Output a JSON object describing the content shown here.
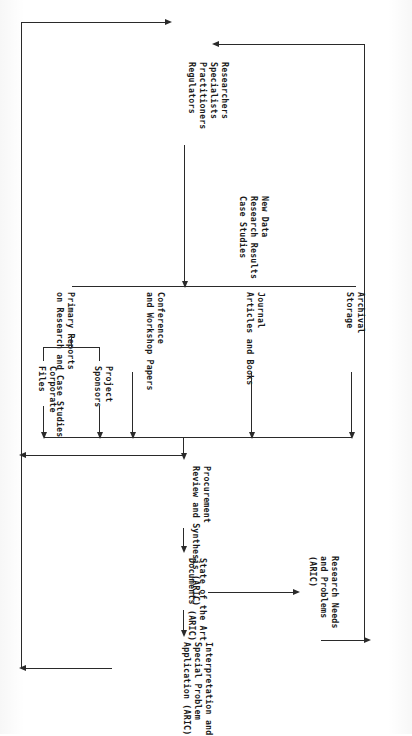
{
  "diagram": {
    "type": "flowchart",
    "orientation": "rotated-90-clockwise",
    "nodes": {
      "primary_reports": "Primary Reports\non Research and Case Studies",
      "project_sponsors": "Project\nSponsors",
      "corporate_files": "Corporate\nFiles",
      "conference_papers": "Conference\nand Workshop Papers",
      "journal_articles": "Journal\nArticles and Books",
      "archival_storage": "Archival\nStorage",
      "producers": "Researchers\nSpecialists\nPractitioners\nRegulators",
      "new_data": "New Data\nResearch Results\nCase Studies",
      "procurement": "Procurement\nReview and Synthesis (ARIC)",
      "state_of_art": "State of the Art\nDocuments (ARIC)",
      "interpretation": "Interpretation and\nSpecial Problem\nApplication (ARIC)",
      "research_needs": "Research Needs\nand Problems\n(ARIC)"
    },
    "node_lines": {
      "primary_reports": [
        "Primary Reports",
        "on Research and Case Studies"
      ],
      "project_sponsors": [
        "Project",
        "Sponsors"
      ],
      "corporate_files": [
        "Corporate",
        "Files"
      ],
      "conference_papers": [
        "Conference",
        "and Workshop Papers"
      ],
      "journal_articles": [
        "Journal",
        "Articles and Books"
      ],
      "archival_storage": [
        "Archival",
        "Storage"
      ],
      "producers": [
        "Researchers",
        "Specialists",
        "Practitioners",
        "Regulators"
      ],
      "new_data": [
        "New Data",
        "Research Results",
        "Case Studies"
      ],
      "procurement": [
        "Procurement",
        "Review and Synthesis (ARIC)"
      ],
      "state_of_art": [
        "State of the Art",
        "Documents (ARIC)"
      ],
      "interpretation": [
        "Interpretation and",
        "Special Problem",
        "Application (ARIC)"
      ],
      "research_needs": [
        "Research Needs",
        "and Problems",
        "(ARIC)"
      ]
    },
    "edges": [
      {
        "from": "project_sponsors",
        "to": "procurement"
      },
      {
        "from": "corporate_files",
        "to": "procurement"
      },
      {
        "from": "conference_papers",
        "to": "procurement"
      },
      {
        "from": "journal_articles",
        "to": "procurement"
      },
      {
        "from": "archival_storage",
        "to": "procurement"
      },
      {
        "from": "procurement",
        "to": "state_of_art"
      },
      {
        "from": "state_of_art",
        "to": "interpretation"
      },
      {
        "from": "state_of_art",
        "to": "research_needs"
      },
      {
        "from": "research_needs",
        "to": "producers"
      },
      {
        "from": "producers",
        "to": "literature_bus"
      },
      {
        "from": "interpretation",
        "to": "producers"
      }
    ],
    "colors": {
      "ink": "#2a2a2a",
      "paper": "#ffffff"
    }
  }
}
